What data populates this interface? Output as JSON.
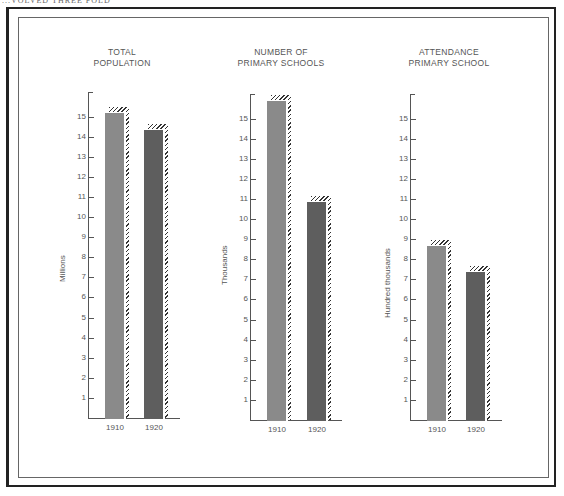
{
  "header": {
    "text": "...VOLVED THREE FOLD"
  },
  "chart_data": [
    {
      "type": "bar",
      "title": "TOTAL POPULATION",
      "title_lines": [
        "TOTAL",
        "POPULATION"
      ],
      "categories": [
        "1910",
        "1920"
      ],
      "values": [
        15.2,
        14.4
      ],
      "xlabel": "",
      "ylabel": "Millions",
      "yticks": [
        1,
        2,
        3,
        4,
        5,
        6,
        7,
        8,
        9,
        10,
        11,
        12,
        13,
        14,
        15
      ],
      "ylim": [
        0,
        16
      ],
      "grid": false,
      "colors": [
        "#8a8a8a",
        "#5e5e5e"
      ]
    },
    {
      "type": "bar",
      "title": "NUMBER OF PRIMARY SCHOOLS",
      "title_lines": [
        "NUMBER OF",
        "PRIMARY SCHOOLS"
      ],
      "categories": [
        "1910",
        "1920"
      ],
      "values": [
        15.9,
        10.9
      ],
      "xlabel": "",
      "ylabel": "Thousands",
      "yticks": [
        1,
        2,
        3,
        4,
        5,
        6,
        7,
        8,
        9,
        10,
        11,
        12,
        13,
        14,
        15
      ],
      "ylim": [
        0,
        16
      ],
      "grid": false,
      "colors": [
        "#8a8a8a",
        "#5e5e5e"
      ]
    },
    {
      "type": "bar",
      "title": "ATTENDANCE PRIMARY SCHOOL",
      "title_lines": [
        "ATTENDANCE",
        "PRIMARY SCHOOL"
      ],
      "categories": [
        "1910",
        "1920"
      ],
      "values": [
        8.7,
        7.4
      ],
      "xlabel": "",
      "ylabel": "Hundred thousands",
      "yticks": [
        1,
        2,
        3,
        4,
        5,
        6,
        7,
        8,
        9,
        10,
        11,
        12,
        13,
        14,
        15
      ],
      "ylim": [
        0,
        16
      ],
      "grid": false,
      "colors": [
        "#8a8a8a",
        "#5e5e5e"
      ]
    }
  ]
}
